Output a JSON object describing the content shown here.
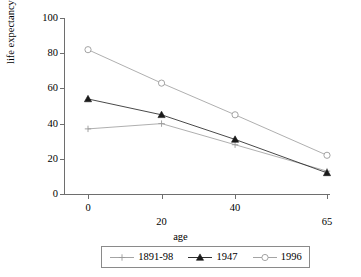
{
  "chart_data": {
    "type": "line",
    "title": "",
    "xlabel": "age",
    "ylabel": "life expectancy",
    "categories": [
      "0",
      "20",
      "40",
      "65"
    ],
    "x": [
      0,
      20,
      40,
      65
    ],
    "ylim": [
      0,
      100
    ],
    "yticks": [
      "0",
      "20",
      "40",
      "60",
      "80",
      "100"
    ],
    "ytick_values": [
      0,
      20,
      40,
      60,
      80,
      100
    ],
    "grid": false,
    "legend_position": "below",
    "series": [
      {
        "name": "1891-98",
        "marker": "plus",
        "color": "#9a9a9a",
        "values": [
          37,
          40,
          28,
          13
        ]
      },
      {
        "name": "1947",
        "marker": "triangle-filled",
        "color": "#1a1a1a",
        "values": [
          54,
          45,
          31,
          12
        ]
      },
      {
        "name": "1996",
        "marker": "circle-open",
        "color": "#9a9a9a",
        "values": [
          82,
          63,
          45,
          22
        ]
      }
    ]
  },
  "legend": {
    "entries": [
      {
        "label": "1891-98",
        "marker": "plus-icon"
      },
      {
        "label": "1947",
        "marker": "triangle-icon"
      },
      {
        "label": "1996",
        "marker": "circle-icon"
      }
    ]
  },
  "axes": {
    "y_title": "life expectancy",
    "x_title": "age",
    "y_ticks": [
      "100",
      "80",
      "60",
      "40",
      "20",
      "0"
    ],
    "x_ticks": [
      "0",
      "20",
      "40",
      "65"
    ]
  },
  "colors": {
    "axis": "#6e6e6e",
    "grey_series": "#9a9a9a",
    "black_series": "#1a1a1a",
    "legend_border": "#8a8a8a",
    "background": "#ffffff"
  }
}
